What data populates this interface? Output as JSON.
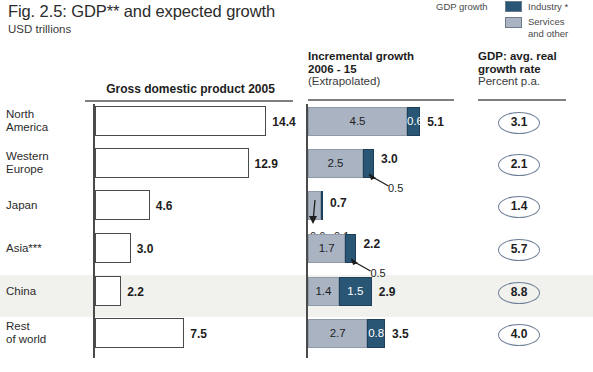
{
  "figure": {
    "title": "Fig. 2.5: GDP** and expected growth",
    "subtitle": "USD trillions"
  },
  "legend": {
    "title": "GDP growth",
    "items": [
      {
        "label": "Industry *",
        "color": "#2a5676",
        "key": "industry"
      },
      {
        "label": "Services\nand other",
        "label_line1": "Services",
        "label_line2": "and other",
        "color": "#a9b3c2",
        "key": "services"
      }
    ]
  },
  "columns": {
    "gdp": {
      "header": "Gross domestic product 2005"
    },
    "incremental": {
      "header_line1": "Incremental growth",
      "header_line2": "2006 - 15",
      "header_line3": "(Extrapolated)"
    },
    "rate": {
      "header_line1": "GDP: avg. real",
      "header_line2": "growth rate",
      "header_line3": "Percent p.a."
    }
  },
  "rows": [
    {
      "label_line1": "North",
      "label_line2": "America",
      "gdp": "14.4",
      "services": "4.5",
      "industry": "0.6",
      "total": "5.1",
      "services_inside": true,
      "industry_inside": true,
      "rate": "3.1",
      "highlight": false
    },
    {
      "label_line1": "Western",
      "label_line2": "Europe",
      "gdp": "12.9",
      "services": "2.5",
      "industry": "0.5",
      "total": "3.0",
      "services_inside": true,
      "industry_inside": false,
      "rate": "2.1",
      "highlight": false
    },
    {
      "label_line1": "Japan",
      "label_line2": "",
      "gdp": "4.6",
      "services": "0.6",
      "industry": "0.1",
      "total": "0.7",
      "services_inside": false,
      "industry_inside": false,
      "rate": "1.4",
      "highlight": false
    },
    {
      "label_line1": "Asia***",
      "label_line2": "",
      "gdp": "3.0",
      "services": "1.7",
      "industry": "0.5",
      "total": "2.2",
      "services_inside": true,
      "industry_inside": false,
      "rate": "5.7",
      "highlight": false
    },
    {
      "label_line1": "China",
      "label_line2": "",
      "gdp": "2.2",
      "services": "1.4",
      "industry": "1.5",
      "total": "2.9",
      "services_inside": true,
      "industry_inside": true,
      "rate": "8.8",
      "highlight": true
    },
    {
      "label_line1": "Rest",
      "label_line2": "of world",
      "gdp": "7.5",
      "services": "2.7",
      "industry": "0.8",
      "total": "3.5",
      "services_inside": true,
      "industry_inside": true,
      "rate": "4.0",
      "highlight": false
    }
  ],
  "chart_data": {
    "type": "bar",
    "title": "Fig. 2.5: GDP** and expected growth",
    "subtitle": "USD trillions",
    "categories": [
      "North America",
      "Western Europe",
      "Japan",
      "Asia***",
      "China",
      "Rest of world"
    ],
    "panels": [
      {
        "name": "Gross domestic product 2005",
        "unit": "USD trillions",
        "values": [
          14.4,
          12.9,
          4.6,
          3.0,
          2.2,
          7.5
        ],
        "style": "outlined-white-bars"
      },
      {
        "name": "Incremental growth 2006 - 15 (Extrapolated)",
        "unit": "USD trillions",
        "stacked": true,
        "series": [
          {
            "name": "Services and other",
            "color": "#a9b3c2",
            "values": [
              4.5,
              2.5,
              0.6,
              1.7,
              1.4,
              2.7
            ]
          },
          {
            "name": "Industry *",
            "color": "#2a5676",
            "values": [
              0.6,
              0.5,
              0.1,
              0.5,
              1.5,
              0.8
            ]
          }
        ],
        "totals": [
          5.1,
          3.0,
          0.7,
          2.2,
          2.9,
          3.5
        ]
      },
      {
        "name": "GDP: avg. real growth rate",
        "unit": "Percent p.a.",
        "values": [
          3.1,
          2.1,
          1.4,
          5.7,
          8.8,
          4.0
        ],
        "style": "ellipse-callouts"
      }
    ],
    "legend_position": "top-right",
    "grid": false,
    "highlighted_category": "China"
  }
}
